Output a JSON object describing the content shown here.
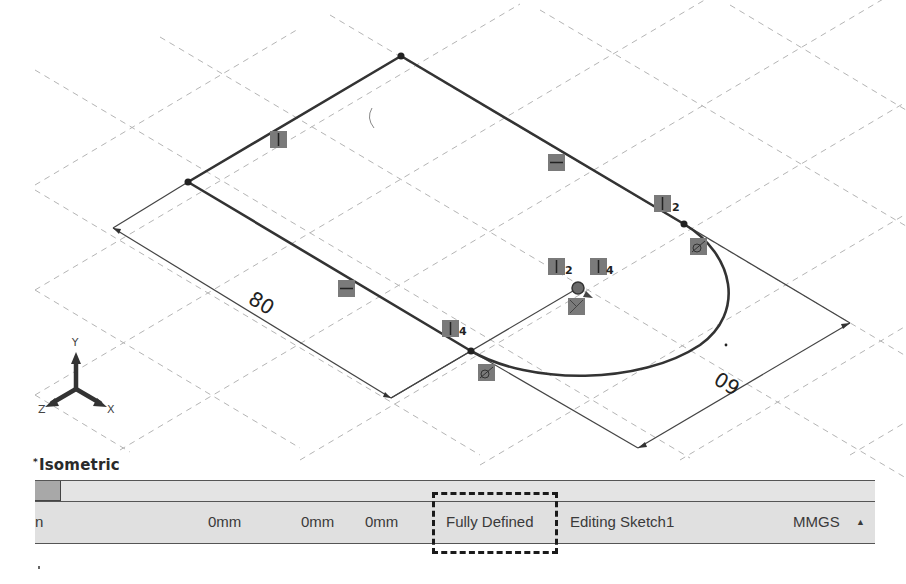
{
  "viewport": {
    "view_orientation": "Isometric",
    "background_color": "#ffffff",
    "grid_color": "#b5b5b5",
    "sketch_line_color": "#333333",
    "relation_badge_color": "#7a7a7a",
    "triad": {
      "x_label": "X",
      "y_label": "Y",
      "z_label": "Z"
    },
    "dimensions": [
      {
        "id": "dim-length",
        "value": "80"
      },
      {
        "id": "dim-width",
        "value": "60"
      }
    ],
    "relations": [
      {
        "type": "vertical",
        "label": "",
        "position": "top-left-edge"
      },
      {
        "type": "horizontal",
        "label": "",
        "position": "top-right-edge"
      },
      {
        "type": "vertical",
        "label": "2",
        "position": "right-edge-end"
      },
      {
        "type": "horizontal",
        "label": "",
        "position": "bottom-left-edge"
      },
      {
        "type": "vertical",
        "label": "4",
        "position": "bottom-edge-end"
      },
      {
        "type": "vertical",
        "label": "2",
        "position": "arc-center-left"
      },
      {
        "type": "vertical",
        "label": "4",
        "position": "arc-center-right"
      },
      {
        "type": "coincident",
        "label": "",
        "position": "arc-center"
      },
      {
        "type": "tangent",
        "label": "",
        "position": "arc-start"
      },
      {
        "type": "tangent",
        "label": "",
        "position": "arc-end"
      }
    ]
  },
  "status_bar": {
    "edge_text": "n",
    "x_coord": "0mm",
    "y_coord": "0mm",
    "z_coord": "0mm",
    "sketch_state": "Fully Defined",
    "editing": "Editing Sketch1",
    "units": "MMGS",
    "units_arrow": "▲",
    "highlight_color": "#1a1a1a"
  }
}
